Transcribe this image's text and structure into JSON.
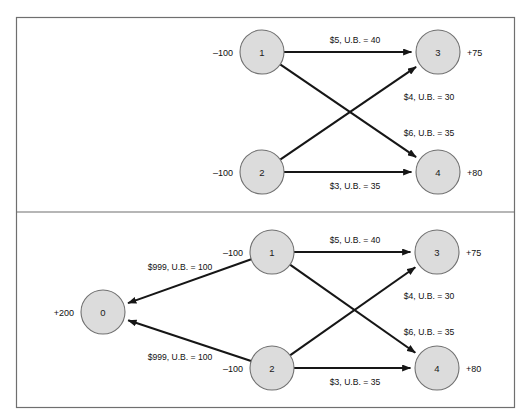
{
  "figure": {
    "panels": [
      {
        "id": "panel-top",
        "name": "original-network",
        "nodes": [
          {
            "id": "1",
            "label": "1",
            "supply": "–100",
            "supply_side": "left",
            "cx": 262,
            "cy": 52,
            "r": 22
          },
          {
            "id": "2",
            "label": "2",
            "supply": "–100",
            "supply_side": "left",
            "cx": 262,
            "cy": 172,
            "r": 22
          },
          {
            "id": "3",
            "label": "3",
            "supply": "+75",
            "supply_side": "right",
            "cx": 438,
            "cy": 52,
            "r": 22
          },
          {
            "id": "4",
            "label": "4",
            "supply": "+80",
            "supply_side": "right",
            "cx": 438,
            "cy": 172,
            "r": 22
          }
        ],
        "edges": [
          {
            "from": "1",
            "to": "3",
            "label": "$5, U.B. = 40",
            "cost": 5,
            "upper_bound": 40,
            "lx": 355,
            "ly": 40
          },
          {
            "from": "2",
            "to": "3",
            "label": "$4, U.B. = 30",
            "cost": 4,
            "upper_bound": 30,
            "lx": 429,
            "ly": 97
          },
          {
            "from": "1",
            "to": "4",
            "label": "$6, U.B. = 35",
            "cost": 6,
            "upper_bound": 35,
            "lx": 429,
            "ly": 133
          },
          {
            "from": "2",
            "to": "4",
            "label": "$3, U.B. = 35",
            "cost": 3,
            "upper_bound": 35,
            "lx": 355,
            "ly": 186
          }
        ]
      },
      {
        "id": "panel-bottom",
        "name": "network-with-artificial-node",
        "nodes": [
          {
            "id": "0",
            "label": "0",
            "supply": "+200",
            "supply_side": "left",
            "cx": 103,
            "cy": 312,
            "r": 22
          },
          {
            "id": "1",
            "label": "1",
            "supply": "–100",
            "supply_side": "left",
            "cx": 272,
            "cy": 252,
            "r": 22
          },
          {
            "id": "2",
            "label": "2",
            "supply": "–100",
            "supply_side": "left",
            "cx": 272,
            "cy": 368,
            "r": 22
          },
          {
            "id": "3",
            "label": "3",
            "supply": "+75",
            "supply_side": "right",
            "cx": 437,
            "cy": 252,
            "r": 22
          },
          {
            "id": "4",
            "label": "4",
            "supply": "+80",
            "supply_side": "right",
            "cx": 437,
            "cy": 368,
            "r": 22
          }
        ],
        "edges": [
          {
            "from": "1",
            "to": "0",
            "label": "$999, U.B. = 100",
            "cost": 999,
            "upper_bound": 100,
            "lx": 180,
            "ly": 267
          },
          {
            "from": "2",
            "to": "0",
            "label": "$999, U.B. = 100",
            "cost": 999,
            "upper_bound": 100,
            "lx": 180,
            "ly": 357
          },
          {
            "from": "1",
            "to": "3",
            "label": "$5, U.B. = 40",
            "cost": 5,
            "upper_bound": 40,
            "lx": 355,
            "ly": 240
          },
          {
            "from": "2",
            "to": "3",
            "label": "$4, U.B. = 30",
            "cost": 4,
            "upper_bound": 30,
            "lx": 429,
            "ly": 296
          },
          {
            "from": "1",
            "to": "4",
            "label": "$6, U.B. = 35",
            "cost": 6,
            "upper_bound": 35,
            "lx": 429,
            "ly": 332
          },
          {
            "from": "2",
            "to": "4",
            "label": "$3, U.B. = 35",
            "cost": 3,
            "upper_bound": 35,
            "lx": 355,
            "ly": 382
          }
        ]
      }
    ],
    "colors": {
      "node_fill": "#dcdcdc",
      "node_stroke": "#707070",
      "edge": "#161616",
      "frame": "#6f6f6f",
      "background": "#ffffff"
    }
  }
}
